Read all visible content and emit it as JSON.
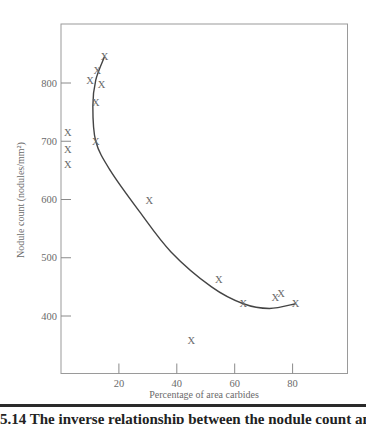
{
  "chart_data": {
    "type": "scatter",
    "title": "",
    "xlabel": "Percentage of area carbides",
    "ylabel": "Nodule count (nodules/mm²)",
    "xlim": [
      0,
      95
    ],
    "ylim": [
      310,
      895
    ],
    "x_ticks": [
      20,
      40,
      60,
      80
    ],
    "y_ticks": [
      400,
      500,
      600,
      700,
      800
    ],
    "grid": false,
    "marker": "X",
    "series": [
      {
        "name": "observations",
        "points": [
          {
            "x": 15,
            "y": 845
          },
          {
            "x": 12.5,
            "y": 822
          },
          {
            "x": 10,
            "y": 805
          },
          {
            "x": 14,
            "y": 797
          },
          {
            "x": 12,
            "y": 767
          },
          {
            "x": 12,
            "y": 700
          },
          {
            "x": 0.5,
            "y": 715
          },
          {
            "x": 0.5,
            "y": 685
          },
          {
            "x": 0.5,
            "y": 660
          },
          {
            "x": 30.5,
            "y": 598
          },
          {
            "x": 54.5,
            "y": 463
          },
          {
            "x": 63,
            "y": 421
          },
          {
            "x": 74,
            "y": 432
          },
          {
            "x": 76,
            "y": 438
          },
          {
            "x": 81,
            "y": 421
          },
          {
            "x": 45,
            "y": 358
          }
        ]
      },
      {
        "name": "fitted-curve",
        "type": "line",
        "points": [
          {
            "x": 15,
            "y": 845
          },
          {
            "x": 12,
            "y": 805
          },
          {
            "x": 11,
            "y": 760
          },
          {
            "x": 12,
            "y": 700
          },
          {
            "x": 17,
            "y": 650
          },
          {
            "x": 27,
            "y": 580
          },
          {
            "x": 38,
            "y": 510
          },
          {
            "x": 52,
            "y": 450
          },
          {
            "x": 63,
            "y": 421
          },
          {
            "x": 72,
            "y": 413
          },
          {
            "x": 81,
            "y": 421
          }
        ]
      }
    ]
  },
  "caption": {
    "text": "5.14  The inverse relationship between the nodule count and"
  }
}
